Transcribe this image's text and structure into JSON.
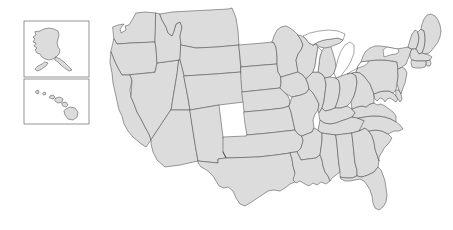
{
  "figure": {
    "title": "Map of the United States",
    "width": 453,
    "height": 230
  },
  "colors": {
    "background": "#ffffff",
    "state_fill": "#dcdcdc",
    "state_border": "#4d4d4d",
    "inset_frame": "#4d4d4d",
    "lake_fill": "#ffffff"
  },
  "insets": [
    {
      "name": "alaska-inset",
      "label": "Alaska",
      "frame": {
        "x": 24,
        "y": 21,
        "width": 65,
        "height": 56
      }
    },
    {
      "name": "hawaii-inset",
      "label": "Hawaii",
      "frame": {
        "x": 24,
        "y": 79,
        "width": 65,
        "height": 45
      }
    }
  ],
  "regions": {
    "contiguous_label": "Contiguous United States",
    "great_lakes_label": "Great Lakes",
    "state_count": 50
  },
  "chart_data": {
    "type": "map",
    "title": "Map of the United States",
    "projection": "albers-usa",
    "unit_label": "state",
    "legend": [],
    "features": [
      {
        "id": "WA",
        "name": "Washington"
      },
      {
        "id": "OR",
        "name": "Oregon"
      },
      {
        "id": "CA",
        "name": "California"
      },
      {
        "id": "NV",
        "name": "Nevada"
      },
      {
        "id": "ID",
        "name": "Idaho"
      },
      {
        "id": "MT",
        "name": "Montana"
      },
      {
        "id": "WY",
        "name": "Wyoming"
      },
      {
        "id": "UT",
        "name": "Utah"
      },
      {
        "id": "AZ",
        "name": "Arizona"
      },
      {
        "id": "CO",
        "name": "Colorado"
      },
      {
        "id": "NM",
        "name": "New Mexico"
      },
      {
        "id": "ND",
        "name": "North Dakota"
      },
      {
        "id": "SD",
        "name": "South Dakota"
      },
      {
        "id": "NE",
        "name": "Nebraska"
      },
      {
        "id": "KS",
        "name": "Kansas"
      },
      {
        "id": "OK",
        "name": "Oklahoma"
      },
      {
        "id": "TX",
        "name": "Texas"
      },
      {
        "id": "MN",
        "name": "Minnesota"
      },
      {
        "id": "IA",
        "name": "Iowa"
      },
      {
        "id": "MO",
        "name": "Missouri"
      },
      {
        "id": "AR",
        "name": "Arkansas"
      },
      {
        "id": "LA",
        "name": "Louisiana"
      },
      {
        "id": "WI",
        "name": "Wisconsin"
      },
      {
        "id": "IL",
        "name": "Illinois"
      },
      {
        "id": "MI",
        "name": "Michigan"
      },
      {
        "id": "IN",
        "name": "Indiana"
      },
      {
        "id": "OH",
        "name": "Ohio"
      },
      {
        "id": "KY",
        "name": "Kentucky"
      },
      {
        "id": "TN",
        "name": "Tennessee"
      },
      {
        "id": "MS",
        "name": "Mississippi"
      },
      {
        "id": "AL",
        "name": "Alabama"
      },
      {
        "id": "GA",
        "name": "Georgia"
      },
      {
        "id": "FL",
        "name": "Florida"
      },
      {
        "id": "SC",
        "name": "South Carolina"
      },
      {
        "id": "NC",
        "name": "North Carolina"
      },
      {
        "id": "VA",
        "name": "Virginia"
      },
      {
        "id": "WV",
        "name": "West Virginia"
      },
      {
        "id": "MD",
        "name": "Maryland"
      },
      {
        "id": "DE",
        "name": "Delaware"
      },
      {
        "id": "PA",
        "name": "Pennsylvania"
      },
      {
        "id": "NJ",
        "name": "New Jersey"
      },
      {
        "id": "NY",
        "name": "New York"
      },
      {
        "id": "CT",
        "name": "Connecticut"
      },
      {
        "id": "RI",
        "name": "Rhode Island"
      },
      {
        "id": "MA",
        "name": "Massachusetts"
      },
      {
        "id": "VT",
        "name": "Vermont"
      },
      {
        "id": "NH",
        "name": "New Hampshire"
      },
      {
        "id": "ME",
        "name": "Maine"
      },
      {
        "id": "AK",
        "name": "Alaska"
      },
      {
        "id": "HI",
        "name": "Hawaii"
      }
    ]
  }
}
